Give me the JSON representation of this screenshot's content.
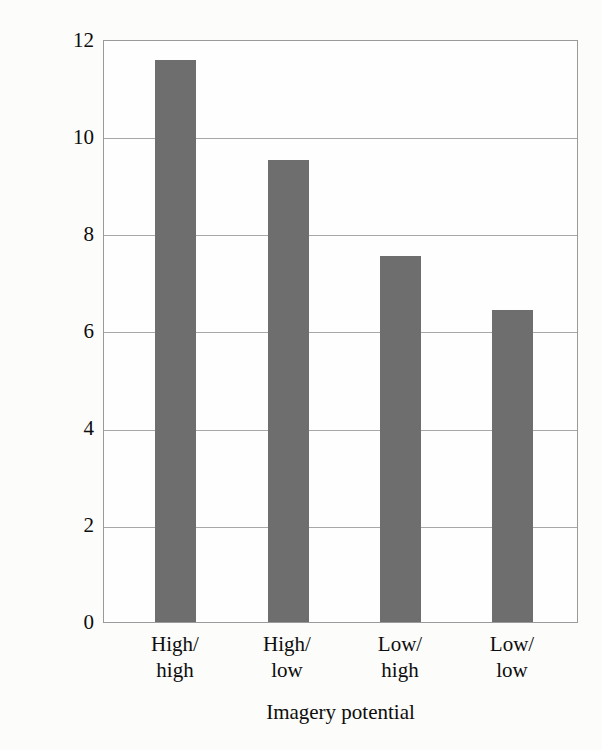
{
  "chart_data": {
    "type": "bar",
    "title": "",
    "categories": [
      "High/high",
      "High/low",
      "Low/high",
      "Low/low"
    ],
    "category_lines": [
      [
        "High/",
        "high"
      ],
      [
        "High/",
        "low"
      ],
      [
        "Low/",
        "high"
      ],
      [
        "Low/",
        "low"
      ]
    ],
    "values": [
      11.6,
      9.55,
      7.55,
      6.45
    ],
    "xlabel": "Imagery potential",
    "ylabel": "Average number of pairs recalled",
    "ylim": [
      0,
      12
    ],
    "ytick_labels": [
      "0",
      "2",
      "4",
      "6",
      "8",
      "10",
      "12"
    ],
    "ytick_values": [
      0,
      2,
      4,
      6,
      8,
      10,
      12
    ],
    "grid": "horizontal",
    "legend": "none",
    "bar_color": "#6e6e6e",
    "grid_color": "#a8a8a8",
    "frame_color": "#9a9a9a",
    "background_color": "#fcfcfa"
  }
}
